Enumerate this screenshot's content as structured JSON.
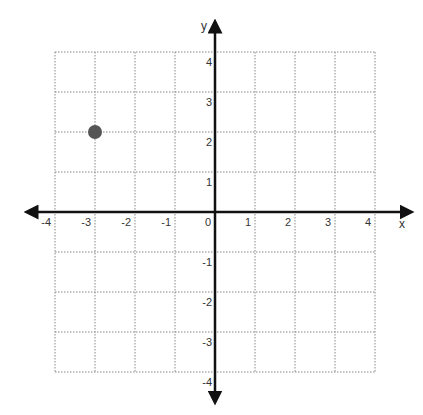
{
  "chart_data": {
    "type": "scatter",
    "title": "",
    "xlabel": "x",
    "ylabel": "y",
    "xlim": [
      -4,
      4
    ],
    "ylim": [
      -4,
      4
    ],
    "grid": true,
    "grid_style": "dotted",
    "x_ticks": [
      "-4",
      "-3",
      "-2",
      "-1",
      "0",
      "1",
      "2",
      "3",
      "4"
    ],
    "y_ticks": [
      "-4",
      "-3",
      "-2",
      "-1",
      "1",
      "2",
      "3",
      "4"
    ],
    "points": [
      {
        "x": -3,
        "y": 2
      }
    ],
    "point_color": "#555555",
    "axis_color": "#111111",
    "grid_color": "#888888"
  },
  "axes": {
    "x_label": "x",
    "y_label": "y"
  },
  "layout": {
    "origin_x": 215,
    "origin_y": 212,
    "unit": 40,
    "point_radius": 7
  }
}
